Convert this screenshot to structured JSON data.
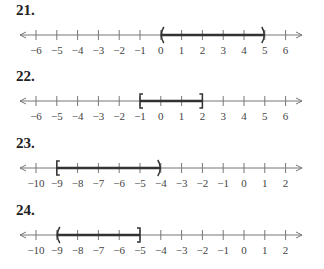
{
  "problems": [
    {
      "number": "21.",
      "ticks": [
        "−6",
        "−5",
        "−4",
        "−3",
        "−2",
        "−1",
        "0",
        "1",
        "2",
        "3",
        "4",
        "5",
        "6"
      ],
      "min": -6,
      "max": 6,
      "interval": {
        "start": 0,
        "end": 5,
        "left": "(",
        "right": ")"
      }
    },
    {
      "number": "22.",
      "ticks": [
        "−6",
        "−5",
        "−4",
        "−3",
        "−2",
        "−1",
        "0",
        "1",
        "2",
        "3",
        "4",
        "5",
        "6"
      ],
      "min": -6,
      "max": 6,
      "interval": {
        "start": -1,
        "end": 2,
        "left": "[",
        "right": "]"
      }
    },
    {
      "number": "23.",
      "ticks": [
        "−10",
        "−9",
        "−8",
        "−7",
        "−6",
        "−5",
        "−4",
        "−3",
        "−2",
        "−1",
        "0",
        "1",
        "2"
      ],
      "min": -10,
      "max": 2,
      "interval": {
        "start": -9,
        "end": -4,
        "left": "[",
        "right": ")"
      }
    },
    {
      "number": "24.",
      "ticks": [
        "−10",
        "−9",
        "−8",
        "−7",
        "−6",
        "−5",
        "−4",
        "−3",
        "−2",
        "−1",
        "0",
        "1",
        "2"
      ],
      "min": -10,
      "max": 2,
      "interval": {
        "start": -9,
        "end": -5,
        "left": "(",
        "right": "]"
      }
    }
  ]
}
